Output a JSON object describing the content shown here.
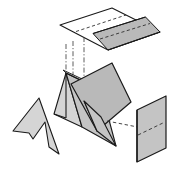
{
  "figure": {
    "background_color": "#ffffff",
    "width": 177,
    "height": 175,
    "stroke_color": "#1a1a1a",
    "palette": {
      "white_face": "#ffffff",
      "light_gray_face": "#d5d5d5",
      "mid_gray_face": "#b9b9b9",
      "dark_gray_face": "#aaaaaa",
      "shadow_gray_face": "#c4c4c4",
      "dashed_line_color": "#303030"
    },
    "line_weights": {
      "solid": 1.1,
      "dashed": 0.9,
      "dash_pattern": "3.2,2.4",
      "dashdot_pattern": "5,2,1.2,2"
    },
    "parts": [
      {
        "name": "top-plane",
        "label": "Top horizontal projection plane",
        "fill": "#ffffff",
        "shaded_region_fill": "#b9b9b9",
        "points": "60,25 112,8 160,32 108,50",
        "shaded_points": "94,34 146,18 160,32 108,50",
        "dashed_trace": "80,30 130,15"
      },
      {
        "name": "prism-body",
        "label": "Triangular prism (tent)",
        "ridge_start": "68,73",
        "ridge_end": "102,108",
        "base_left": "56,112",
        "base_right": "88,130",
        "left_face_fill": "#d5d5d5",
        "front_face_fill": "#c4c4c4"
      },
      {
        "name": "cutting-plane",
        "label": "Oblique cutting plane through prism",
        "fill": "#b9b9b9",
        "points": "73,86 110,64 127,101 96,128"
      },
      {
        "name": "arrow-section",
        "label": "Arrow-shaped cross-section outline",
        "fill": "#d5d5d5",
        "points": "14,129 39,99 58,152 48,146 45,124 33,137 30,131"
      },
      {
        "name": "right-plane",
        "label": "Right vertical projection plane",
        "fill": "#c4c4c4",
        "points": "137,110 164,95 164,150 137,163",
        "dashed_trace": "137,135 164,124"
      },
      {
        "name": "projection-lines",
        "label": "Dash-dot projection construction lines",
        "lines": [
          "68,44 68,108",
          "75,40 75,104",
          "84,37 84,100",
          "106,122 160,128"
        ]
      }
    ]
  },
  "caption": ""
}
